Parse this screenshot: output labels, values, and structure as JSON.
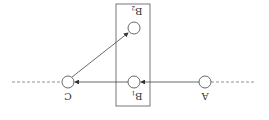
{
  "diagram": {
    "orientation": "rotated-180",
    "nodes": [
      {
        "id": "A",
        "label": "A",
        "sub": "",
        "x": 205,
        "y": 82
      },
      {
        "id": "B1",
        "label": "B",
        "sub": "1",
        "x": 134,
        "y": 82
      },
      {
        "id": "B2",
        "label": "B",
        "sub": "2",
        "x": 134,
        "y": 28
      },
      {
        "id": "C",
        "label": "C",
        "sub": "",
        "x": 68,
        "y": 82
      }
    ],
    "edges": [
      {
        "from": "A",
        "to": "B1"
      },
      {
        "from": "B1",
        "to": "C"
      },
      {
        "from": "C",
        "to": "B2"
      }
    ],
    "box": {
      "label": "B group",
      "x": 116,
      "y": 4,
      "w": 34,
      "h": 102
    },
    "colors": {
      "stroke": "#555555",
      "background": "#ffffff"
    }
  }
}
